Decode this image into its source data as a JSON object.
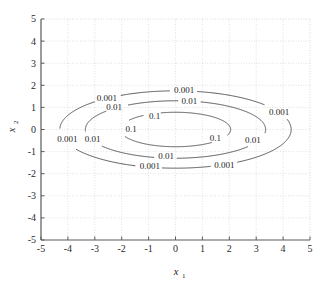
{
  "figure": {
    "background_color": "#ffffff",
    "width": 336,
    "height": 285
  },
  "axes": {
    "frame_color": "#6e6e6e",
    "grid_color": "#b9b9b9",
    "grid": "on",
    "grid_style": "dotted",
    "x_label": "x",
    "x_label_sub": "1",
    "y_label": "x",
    "y_label_sub": "2",
    "x_ticks": [
      "-5",
      "-4",
      "-3",
      "-2",
      "-1",
      "0",
      "1",
      "2",
      "3",
      "4",
      "5"
    ],
    "y_ticks": [
      "5",
      "4",
      "3",
      "2",
      "1",
      "0",
      "-1",
      "-2",
      "-3",
      "-4",
      "-5"
    ]
  },
  "chart_data": {
    "type": "line",
    "chart_subtype": "contour",
    "title": "",
    "xlabel": "x1",
    "ylabel": "x2",
    "xlim": [
      -5,
      5
    ],
    "ylim": [
      -5,
      5
    ],
    "xticks": [
      -5,
      -4,
      -3,
      -2,
      -1,
      0,
      1,
      2,
      3,
      4,
      5
    ],
    "yticks": [
      -5,
      -4,
      -3,
      -2,
      -1,
      0,
      1,
      2,
      3,
      4,
      5
    ],
    "grid": true,
    "legend": "none",
    "contour_color": "#3a3a3a",
    "levels": [
      0.001,
      0.01,
      0.1
    ],
    "level_labels": [
      "0.001",
      "0.01",
      "0.1"
    ],
    "contours": [
      {
        "level": 0.001,
        "label": "0.001",
        "shape": "ellipse",
        "center": [
          0,
          0
        ],
        "semi_axis_x": 4.3,
        "semi_axis_y": 1.75
      },
      {
        "level": 0.01,
        "label": "0.01",
        "shape": "ellipse",
        "center": [
          0,
          0
        ],
        "semi_axis_x": 3.35,
        "semi_axis_y": 1.3
      },
      {
        "level": 0.1,
        "label": "0.1",
        "shape": "ellipse",
        "center": [
          0,
          0
        ],
        "semi_axis_x": 2.05,
        "semi_axis_y": 0.78
      }
    ],
    "inline_labels": [
      {
        "text": "0.001",
        "x": -2.55,
        "y": 1.42,
        "level": 0.001
      },
      {
        "text": "0.001",
        "x": 0.32,
        "y": 1.78,
        "level": 0.001
      },
      {
        "text": "0.001",
        "x": 3.85,
        "y": 0.82,
        "level": 0.001
      },
      {
        "text": "0.001",
        "x": -4.02,
        "y": -0.42,
        "level": 0.001
      },
      {
        "text": "0.001",
        "x": -0.95,
        "y": -1.62,
        "level": 0.001
      },
      {
        "text": "0.001",
        "x": 1.82,
        "y": -1.6,
        "level": 0.001
      },
      {
        "text": "0.01",
        "x": -2.28,
        "y": 1.02,
        "level": 0.01
      },
      {
        "text": "0.01",
        "x": 0.52,
        "y": 1.28,
        "level": 0.01
      },
      {
        "text": "0.01",
        "x": -3.08,
        "y": -0.42,
        "level": 0.01
      },
      {
        "text": "0.01",
        "x": 2.88,
        "y": -0.45,
        "level": 0.01
      },
      {
        "text": "0.01",
        "x": -0.35,
        "y": -1.18,
        "level": 0.01
      },
      {
        "text": "0.1",
        "x": -0.78,
        "y": 0.62,
        "level": 0.1
      },
      {
        "text": "0.1",
        "x": -1.65,
        "y": 0.05,
        "level": 0.1
      },
      {
        "text": "0.1",
        "x": 1.48,
        "y": -0.38,
        "level": 0.1
      }
    ]
  }
}
